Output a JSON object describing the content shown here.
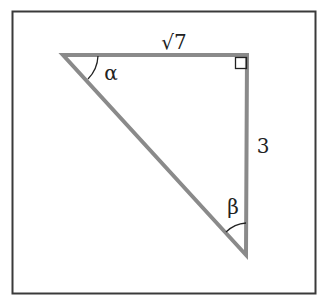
{
  "figure": {
    "type": "right-triangle",
    "colors": {
      "background": "#ffffff",
      "frame": "#3a3a3a",
      "triangle_edge": "#8a8a8a",
      "annotation": "#222222"
    },
    "vertices": {
      "alpha_vertex": {
        "x": 63,
        "y": 55
      },
      "right_angle_vertex": {
        "x": 247,
        "y": 55
      },
      "beta_vertex": {
        "x": 246,
        "y": 255
      }
    },
    "labels": {
      "top_side": "√7",
      "right_side": "3",
      "angle_alpha": "α",
      "angle_beta": "β"
    },
    "right_angle_marker": true
  }
}
